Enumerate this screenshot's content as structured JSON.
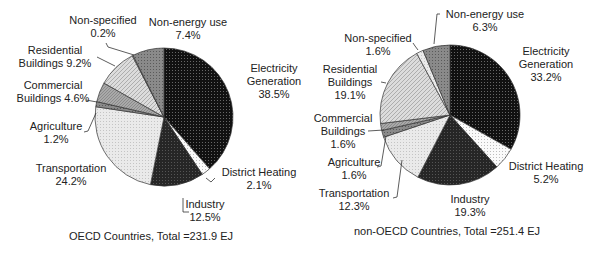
{
  "chart_data": [
    {
      "type": "pie",
      "title": "OECD Countries, Total =231.9 EJ",
      "total_ej": 231.9,
      "start_angle": "12 o'clock, clockwise",
      "categories": [
        "Electricity Generation",
        "District Heating",
        "Industry",
        "Transportation",
        "Agriculture",
        "Commercial Buildings",
        "Residential Buildings",
        "Non-specified",
        "Non-energy use"
      ],
      "values": [
        38.5,
        2.1,
        12.5,
        24.2,
        1.2,
        4.6,
        9.2,
        0.2,
        7.4
      ],
      "labels": [
        [
          "Electricity",
          "Generation",
          "38.5%"
        ],
        [
          "District Heating",
          "2.1%"
        ],
        [
          "Industry",
          "12.5%"
        ],
        [
          "Transportation",
          "24.2%"
        ],
        [
          "Agriculture",
          "1.2%"
        ],
        [
          "Commercial",
          "Buildings 4.6%"
        ],
        [
          "Residential",
          "Buildings 9.2%"
        ],
        [
          "Non-specified",
          "0.2%"
        ],
        [
          "Non-energy use",
          "7.4%"
        ]
      ]
    },
    {
      "type": "pie",
      "title": "non-OECD Countries, Total =251.4 EJ",
      "total_ej": 251.4,
      "start_angle": "12 o'clock, clockwise",
      "categories": [
        "Electricity Generation",
        "District Heating",
        "Industry",
        "Transportation",
        "Agriculture",
        "Commercial Buildings",
        "Residential Buildings",
        "Non-specified",
        "Non-energy use"
      ],
      "values": [
        33.2,
        5.2,
        19.3,
        12.3,
        1.6,
        1.6,
        19.1,
        1.6,
        6.3
      ],
      "labels": [
        [
          "Electricity",
          "Generation",
          "33.2%"
        ],
        [
          "District Heating",
          "5.2%"
        ],
        [
          "Industry",
          "19.3%"
        ],
        [
          "Transportation",
          "12.3%"
        ],
        [
          "Agriculture",
          "1.6%"
        ],
        [
          "Commercial",
          "Buildings",
          "1.6%"
        ],
        [
          "Residential",
          "Buildings",
          "19.1%"
        ],
        [
          "Non-specified",
          "1.6%"
        ],
        [
          "Non-energy use",
          "6.3%"
        ]
      ]
    }
  ],
  "fills": [
    "#151515",
    "#f4f4f4",
    "#2a2a2a",
    "#e2e2e2",
    "#555555",
    "#9a9a9a",
    "#d0d0d0",
    "#bdbdbd",
    "#7e7e7e"
  ]
}
